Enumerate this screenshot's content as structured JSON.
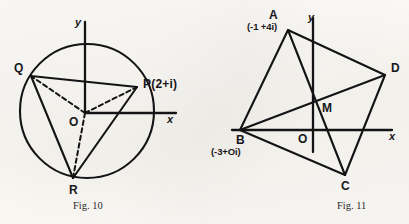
{
  "page": {
    "background_color": "#fbfaf7",
    "ink_color": "#141416",
    "width": 409,
    "height": 224
  },
  "figures": [
    {
      "id": "fig-10",
      "caption": "Fig. 10",
      "description": "Circle centred at origin with inscribed triangle PQR, dashed radii from centre O to each vertex",
      "axes": {
        "x_label": "x",
        "y_label": "y",
        "origin_label": "O"
      },
      "circle": {
        "cx": 87,
        "cy": 111,
        "r": 67
      },
      "points": [
        {
          "name": "P",
          "label": "P(2+i)",
          "x": 137,
          "y": 87,
          "label_x": 144,
          "label_y": 81
        },
        {
          "name": "Q",
          "label": "Q",
          "x": 31,
          "y": 76,
          "label_x": 17,
          "label_y": 65
        },
        {
          "name": "R",
          "label": "R",
          "x": 73,
          "y": 178,
          "label_x": 69,
          "label_y": 188
        },
        {
          "name": "O",
          "label": "O",
          "x": 85,
          "y": 113,
          "label_x": 70,
          "label_y": 120
        }
      ],
      "solid_edges": [
        [
          "Q",
          "P"
        ],
        [
          "Q",
          "R"
        ],
        [
          "R",
          "P"
        ]
      ],
      "dashed_edges": [
        [
          "O",
          "Q"
        ],
        [
          "O",
          "P"
        ],
        [
          "O",
          "R"
        ]
      ]
    },
    {
      "id": "fig-11",
      "caption": "Fig. 11",
      "description": "Quadrilateral ABCD with diagonals AC and BD meeting at midpoint M, drawn on x-y axes",
      "axes": {
        "x_label": "x",
        "y_label": "y",
        "origin_label": "O"
      },
      "points": [
        {
          "name": "A",
          "label": "A",
          "coord_label": "(-1 +4i)",
          "x": 288,
          "y": 30,
          "label_x": 269,
          "label_y": 15,
          "coord_x": 247,
          "coord_y": 27
        },
        {
          "name": "B",
          "label": "B",
          "coord_label": "(-3+Oi)",
          "x": 240,
          "y": 130,
          "label_x": 240,
          "label_y": 140,
          "coord_x": 211,
          "coord_y": 152
        },
        {
          "name": "C",
          "label": "C",
          "coord_label": "",
          "x": 345,
          "y": 175,
          "label_x": 342,
          "label_y": 185,
          "coord_x": 0,
          "coord_y": 0
        },
        {
          "name": "D",
          "label": "D",
          "coord_label": "",
          "x": 385,
          "y": 75,
          "label_x": 391,
          "label_y": 67,
          "coord_x": 0,
          "coord_y": 0
        },
        {
          "name": "M",
          "label": "M",
          "coord_label": "",
          "x": 317,
          "y": 110,
          "label_x": 322,
          "label_y": 105,
          "coord_x": 0,
          "coord_y": 0
        },
        {
          "name": "O",
          "label": "O",
          "coord_label": "",
          "x": 313,
          "y": 130,
          "label_x": 299,
          "label_y": 136,
          "coord_x": 0,
          "coord_y": 0
        }
      ],
      "solid_edges": [
        [
          "A",
          "B"
        ],
        [
          "B",
          "C"
        ],
        [
          "C",
          "D"
        ],
        [
          "D",
          "A"
        ],
        [
          "A",
          "C"
        ],
        [
          "B",
          "D"
        ]
      ]
    }
  ],
  "bleed_text": {
    "top_left": "",
    "top_right": ""
  }
}
